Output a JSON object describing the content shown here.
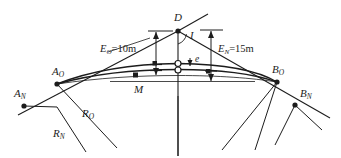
{
  "figure": {
    "stroke_color": "#1c1c1c",
    "background_color": "#ffffff"
  },
  "labels": {
    "apex_point": "D",
    "angle": "I",
    "external_old": {
      "symbol": "E",
      "subscript": "O",
      "equals": "=10m",
      "full": "E_O=10m"
    },
    "external_new": {
      "symbol": "E",
      "subscript": "N",
      "equals": "=15m",
      "full": "E_N=15m"
    },
    "offset": "e",
    "midpoint": "M",
    "start_old": {
      "symbol": "A",
      "subscript": "O"
    },
    "start_new": {
      "symbol": "A",
      "subscript": "N"
    },
    "end_old": {
      "symbol": "B",
      "subscript": "O"
    },
    "end_new": {
      "symbol": "B",
      "subscript": "N"
    },
    "radius_old": {
      "symbol": "R",
      "subscript": "O"
    },
    "radius_new": {
      "symbol": "R",
      "subscript": "N"
    }
  },
  "values": {
    "external_old_m": 10,
    "external_new_m": 15
  }
}
